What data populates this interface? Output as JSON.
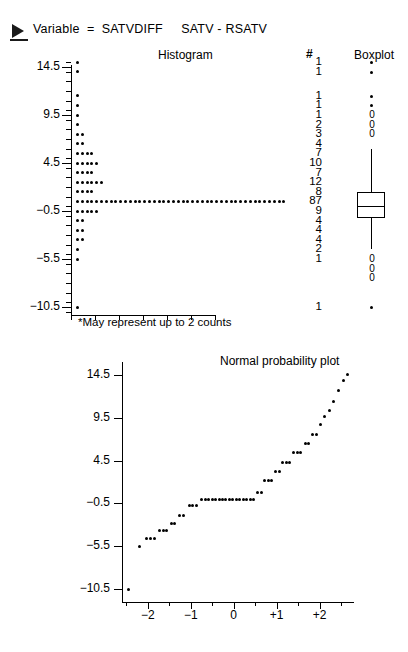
{
  "header": {
    "arrow_icon": "triangle-right-icon",
    "variable_line": "Variable  =  SATVDIFF     SATV - RSATV"
  },
  "panels": {
    "histogram_title": "Histogram",
    "count_title": "#",
    "boxplot_title": "Boxplot",
    "normal_plot_title": "Normal probability plot",
    "footnote": "*May represent up to 2 counts"
  },
  "chart_data": [
    {
      "type": "bar",
      "title": "Histogram",
      "orientation": "horizontal",
      "xlabel": "",
      "ylabel": "SATVDIFF",
      "ylim": [
        -12.5,
        16.0
      ],
      "grid": false,
      "dot_scale": "each dot may represent up to 2 counts",
      "y_tick_labels": [
        "14.5",
        "9.5",
        "4.5",
        "-0.5",
        "-5.5",
        "-10.5"
      ],
      "y_tick_values": [
        14.5,
        9.5,
        4.5,
        -0.5,
        -5.5,
        -10.5
      ],
      "bin_centers": [
        15.0,
        14.0,
        11.5,
        10.5,
        9.5,
        8.5,
        7.5,
        6.5,
        5.5,
        4.5,
        3.5,
        2.5,
        1.5,
        0.5,
        -0.5,
        -1.5,
        -2.5,
        -3.5,
        -4.5,
        -5.5,
        -10.5
      ],
      "counts": [
        1,
        1,
        1,
        1,
        1,
        2,
        3,
        4,
        7,
        10,
        7,
        12,
        8,
        87,
        9,
        4,
        4,
        4,
        2,
        1,
        1
      ],
      "count_labels": [
        "1",
        "1",
        "1",
        "1",
        "1",
        "2",
        "3",
        "4",
        "7",
        "10",
        "7",
        "12",
        "8",
        "87",
        "9",
        "4",
        "4",
        "4",
        "2",
        "1",
        "1"
      ],
      "total_n": 170
    },
    {
      "type": "boxplot",
      "title": "Boxplot",
      "ylim": [
        -12.5,
        16.0
      ],
      "median": 0.0,
      "q1": -1.0,
      "q3": 1.5,
      "whisker_low": -4.5,
      "whisker_high": 6.0,
      "mild_outliers_marker": "0",
      "mild_outliers": [
        7.5,
        8.5,
        9.5,
        -5.5,
        -6.5,
        -7.5
      ],
      "extreme_outliers_marker": "*",
      "extreme_outliers": [
        15.0,
        14.0,
        11.5,
        10.5,
        -10.5
      ]
    },
    {
      "type": "scatter",
      "title": "Normal probability plot",
      "xlabel": "",
      "ylabel": "",
      "xlim": [
        -2.6,
        2.8
      ],
      "ylim": [
        -12.0,
        16.0
      ],
      "grid": false,
      "x_tick_labels": [
        "-2",
        "-1",
        "0",
        "+1",
        "+2"
      ],
      "x_tick_values": [
        -2,
        -1,
        0,
        1,
        2
      ],
      "y_tick_labels": [
        "14.5",
        "9.5",
        "4.5",
        "-0.5",
        "-5.5",
        "-10.5"
      ],
      "y_tick_values": [
        14.5,
        9.5,
        4.5,
        -0.5,
        -5.5,
        -10.5
      ],
      "points": [
        [
          -2.45,
          -10.5
        ],
        [
          -2.2,
          -5.5
        ],
        [
          -2.02,
          -4.6
        ],
        [
          -1.93,
          -4.6
        ],
        [
          -1.85,
          -4.6
        ],
        [
          -1.72,
          -3.6
        ],
        [
          -1.64,
          -3.6
        ],
        [
          -1.56,
          -3.6
        ],
        [
          -1.45,
          -2.8
        ],
        [
          -1.37,
          -2.8
        ],
        [
          -1.26,
          -1.9
        ],
        [
          -1.18,
          -1.9
        ],
        [
          -1.03,
          -0.7
        ],
        [
          -0.95,
          -0.7
        ],
        [
          -0.87,
          -0.7
        ],
        [
          -0.74,
          0.0
        ],
        [
          -0.66,
          0.0
        ],
        [
          -0.58,
          0.0
        ],
        [
          -0.5,
          0.0
        ],
        [
          -0.42,
          0.0
        ],
        [
          -0.34,
          0.0
        ],
        [
          -0.26,
          0.0
        ],
        [
          -0.18,
          0.0
        ],
        [
          -0.1,
          0.0
        ],
        [
          -0.02,
          0.0
        ],
        [
          0.06,
          0.0
        ],
        [
          0.14,
          0.0
        ],
        [
          0.22,
          0.0
        ],
        [
          0.3,
          0.0
        ],
        [
          0.38,
          0.0
        ],
        [
          0.46,
          0.0
        ],
        [
          0.56,
          0.8
        ],
        [
          0.64,
          0.8
        ],
        [
          0.72,
          2.2
        ],
        [
          0.8,
          2.2
        ],
        [
          0.88,
          2.2
        ],
        [
          0.98,
          3.2
        ],
        [
          1.06,
          3.2
        ],
        [
          1.14,
          4.3
        ],
        [
          1.22,
          4.3
        ],
        [
          1.3,
          4.3
        ],
        [
          1.4,
          5.4
        ],
        [
          1.48,
          5.4
        ],
        [
          1.56,
          5.4
        ],
        [
          1.66,
          6.5
        ],
        [
          1.74,
          6.5
        ],
        [
          1.84,
          7.6
        ],
        [
          1.92,
          7.6
        ],
        [
          2.02,
          8.7
        ],
        [
          2.12,
          9.6
        ],
        [
          2.22,
          10.4
        ],
        [
          2.32,
          11.4
        ],
        [
          2.44,
          12.7
        ],
        [
          2.56,
          13.8
        ],
        [
          2.66,
          14.6
        ]
      ]
    }
  ]
}
